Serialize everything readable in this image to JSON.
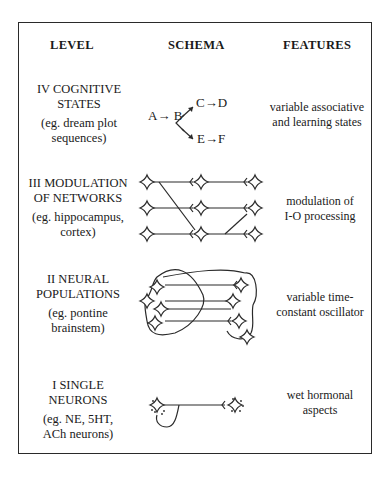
{
  "headers": {
    "level": "LEVEL",
    "schema": "SCHEMA",
    "features": "FEATURES"
  },
  "rows": [
    {
      "level_line1": "IV  COGNITIVE",
      "level_line2": "STATES",
      "example_line1": "(eg. dream plot",
      "example_line2": "sequences)",
      "schema": {
        "type": "sequence-branch",
        "nodes": [
          "A",
          "B",
          "C",
          "D",
          "E",
          "F"
        ],
        "label_ab": "A→ B",
        "label_cd": "C→D",
        "label_ef": "E→F"
      },
      "features_line1": "variable associative",
      "features_line2": "and learning states"
    },
    {
      "level_line1": "III MODULATION",
      "level_line2": "OF NETWORKS",
      "example_line1": "(eg. hippocampus,",
      "example_line2": "cortex)",
      "schema": {
        "type": "network-grid"
      },
      "features_line1": "modulation of",
      "features_line2": "I-O processing"
    },
    {
      "level_line1": "II  NEURAL",
      "level_line2": "POPULATIONS",
      "example_line1": "(eg. pontine",
      "example_line2": "brainstem)",
      "schema": {
        "type": "population-loops"
      },
      "features_line1": "variable time-",
      "features_line2": "constant oscillator"
    },
    {
      "level_line1": "I  SINGLE",
      "level_line2": "NEURONS",
      "example_line1": "(eg. NE, 5HT,",
      "example_line2": "ACh neurons)",
      "schema": {
        "type": "single-neuron"
      },
      "features_line1": "wet hormonal",
      "features_line2": "aspects"
    }
  ]
}
